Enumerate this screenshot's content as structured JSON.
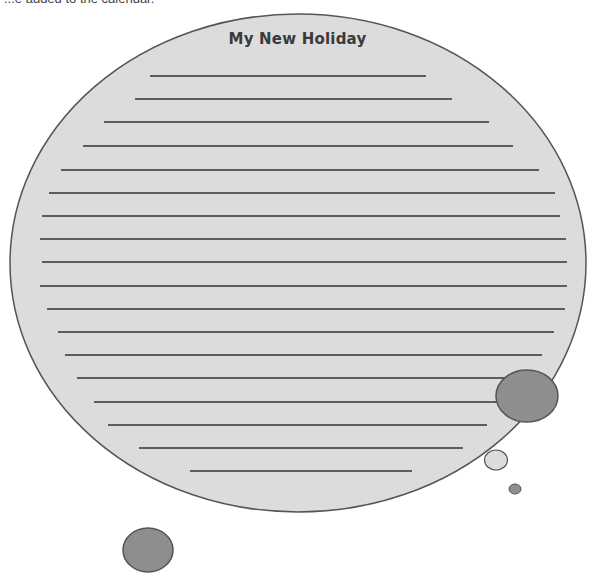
{
  "header": {
    "cut_off_text": "...e added to the calendar."
  },
  "worksheet": {
    "title": "My New Holiday",
    "writing_lines": [
      {
        "y": 76,
        "x1": 150,
        "x2": 426
      },
      {
        "y": 99,
        "x1": 135,
        "x2": 452
      },
      {
        "y": 122,
        "x1": 104,
        "x2": 489
      },
      {
        "y": 146,
        "x1": 83,
        "x2": 513
      },
      {
        "y": 170,
        "x1": 61,
        "x2": 539
      },
      {
        "y": 193,
        "x1": 49,
        "x2": 555
      },
      {
        "y": 216,
        "x1": 42,
        "x2": 560
      },
      {
        "y": 239,
        "x1": 40,
        "x2": 566
      },
      {
        "y": 262,
        "x1": 42,
        "x2": 567
      },
      {
        "y": 286,
        "x1": 40,
        "x2": 567
      },
      {
        "y": 309,
        "x1": 47,
        "x2": 565
      },
      {
        "y": 332,
        "x1": 58,
        "x2": 554
      },
      {
        "y": 355,
        "x1": 65,
        "x2": 542
      },
      {
        "y": 378,
        "x1": 77,
        "x2": 520
      },
      {
        "y": 402,
        "x1": 94,
        "x2": 510
      },
      {
        "y": 425,
        "x1": 108,
        "x2": 487
      },
      {
        "y": 448,
        "x1": 139,
        "x2": 463
      },
      {
        "y": 471,
        "x1": 190,
        "x2": 412
      }
    ]
  },
  "colors": {
    "bubble_fill": "#dcdcdc",
    "bubble_stroke": "#555555",
    "dark_bubble_fill": "#8e8e8e",
    "line_color": "#333333"
  }
}
